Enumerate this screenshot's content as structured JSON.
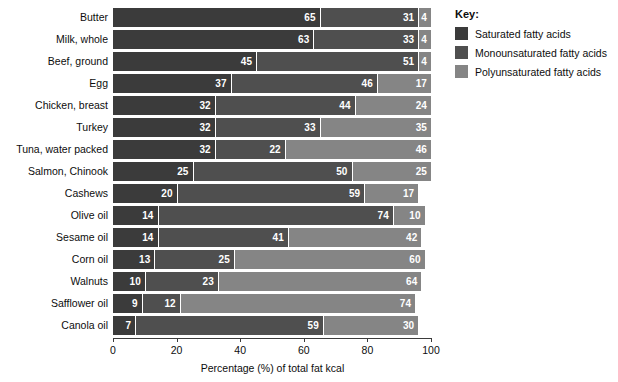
{
  "chart_data": {
    "type": "bar",
    "orientation": "horizontal",
    "stacked": true,
    "stack_total": 100,
    "title": "",
    "xlabel": "Percentage (%) of total fat kcal",
    "ylabel": "",
    "xlim": [
      0,
      100
    ],
    "xticks": [
      0,
      20,
      40,
      60,
      80,
      100
    ],
    "xtick_labels": [
      "0",
      "20",
      "40",
      "60",
      "80",
      "100"
    ],
    "grid": false,
    "legend_position": "right",
    "categories": [
      "Butter",
      "Milk, whole",
      "Beef, ground",
      "Egg",
      "Chicken, breast",
      "Turkey",
      "Tuna, water packed",
      "Salmon, Chinook",
      "Cashews",
      "Olive oil",
      "Sesame oil",
      "Corn oil",
      "Walnuts",
      "Safflower oil",
      "Canola oil"
    ],
    "series": [
      {
        "name": "Saturated fatty acids",
        "color": "#3b3b3b",
        "values": [
          65,
          63,
          45,
          37,
          32,
          32,
          32,
          25,
          20,
          14,
          14,
          13,
          10,
          9,
          7
        ]
      },
      {
        "name": "Monounsaturated fatty acids",
        "color": "#4f4f4f",
        "values": [
          31,
          33,
          51,
          46,
          44,
          33,
          22,
          50,
          59,
          74,
          41,
          25,
          23,
          12,
          59
        ]
      },
      {
        "name": "Polyunsaturated fatty acids",
        "color": "#858585",
        "values": [
          4,
          4,
          4,
          17,
          24,
          35,
          46,
          25,
          17,
          10,
          42,
          60,
          64,
          74,
          30
        ]
      }
    ]
  },
  "legend": {
    "title": "Key:",
    "items": [
      {
        "label": "Saturated fatty acids",
        "swatch": "sat"
      },
      {
        "label": "Monounsaturated fatty acids",
        "swatch": "mono"
      },
      {
        "label": "Polyunsaturated fatty acids",
        "swatch": "poly"
      }
    ]
  },
  "axis": {
    "x_title": "Percentage (%) of total fat kcal"
  },
  "colors": {
    "saturated": "#3b3b3b",
    "monounsaturated": "#4f4f4f",
    "polyunsaturated": "#858585",
    "background": "#ffffff",
    "text": "#0d0d0d",
    "value_label": "#ffffff"
  }
}
